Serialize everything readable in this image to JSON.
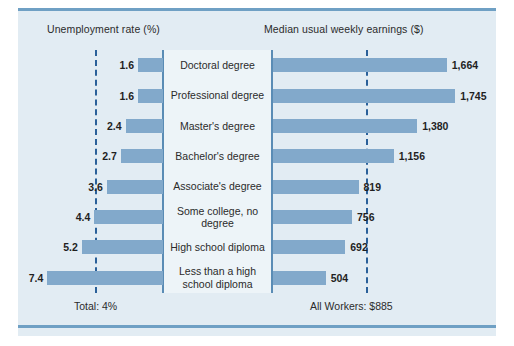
{
  "chart_data": {
    "type": "bar",
    "orientation": "horizontal",
    "layout": "diverging-paired-bars",
    "title": "",
    "panels": [
      {
        "id": "unemployment",
        "title": "Unemployment rate (%)",
        "direction": "left",
        "unit": "%",
        "axis_max": 8,
        "reference": {
          "value": 4,
          "label": "Total: 4%"
        }
      },
      {
        "id": "earnings",
        "title": "Median usual weekly earnings ($)",
        "direction": "right",
        "unit": "$",
        "axis_max": 1800,
        "reference": {
          "value": 885,
          "label": "All Workers: $885"
        }
      }
    ],
    "categories": [
      "Doctoral degree",
      "Professional degree",
      "Master's degree",
      "Bachelor's degree",
      "Associate's degree",
      "Some college, no degree",
      "High school diploma",
      "Less than a high school diploma"
    ],
    "series": [
      {
        "name": "Unemployment rate (%)",
        "panel": "unemployment",
        "values": [
          1.6,
          1.6,
          2.4,
          2.7,
          3.6,
          4.4,
          5.2,
          7.4
        ],
        "labels": [
          "1.6",
          "1.6",
          "2.4",
          "2.7",
          "3.6",
          "4.4",
          "5.2",
          "7.4"
        ]
      },
      {
        "name": "Median usual weekly earnings ($)",
        "panel": "earnings",
        "values": [
          1664,
          1745,
          1380,
          1156,
          819,
          756,
          692,
          504
        ],
        "labels": [
          "1,664",
          "1,745",
          "1,380",
          "1,156",
          "819",
          "756",
          "692",
          "504"
        ]
      }
    ],
    "grid": false,
    "legend": "none",
    "colors": {
      "bar": "#82a9cb",
      "panel_background": "#e2ecf3",
      "center_strip": "#edf4f8",
      "axis_line": "#5a8cb5",
      "reference_line": "#2a6099",
      "rule": "#6fa0c4",
      "text": "#2b2b2b"
    }
  },
  "footers": {
    "left": "Total: 4%",
    "right": "All Workers: $885"
  }
}
